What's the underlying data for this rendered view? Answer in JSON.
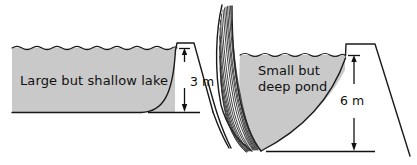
{
  "figure": {
    "title": "",
    "background_color": "#ffffff",
    "water_fill_color": "#c9c9c9",
    "ink_color": "#1a1a1a"
  },
  "panels": [
    {
      "id": "left",
      "name": "large-shallow-lake",
      "body_label": "Large but shallow lake",
      "depth_label": "3 m",
      "depth_value": 3,
      "depth_unit": "m",
      "description": "A wide reservoir of shallow water held behind a dam on its right side"
    },
    {
      "id": "right",
      "name": "small-deep-pond",
      "body_label_line1": "Small but",
      "body_label_line2": "deep pond",
      "body_label": "Small but deep pond",
      "depth_label": "6 m",
      "depth_value": 6,
      "depth_unit": "m",
      "description": "A narrow reservoir of deep water between a steep hatched cliff and a dam"
    }
  ],
  "icons": {
    "water_surface": "wavy-water-line-icon",
    "cliff_hatching": "hatched-cliff-icon",
    "arrow_up": "arrow-up-icon",
    "arrow_down": "arrow-down-icon"
  }
}
